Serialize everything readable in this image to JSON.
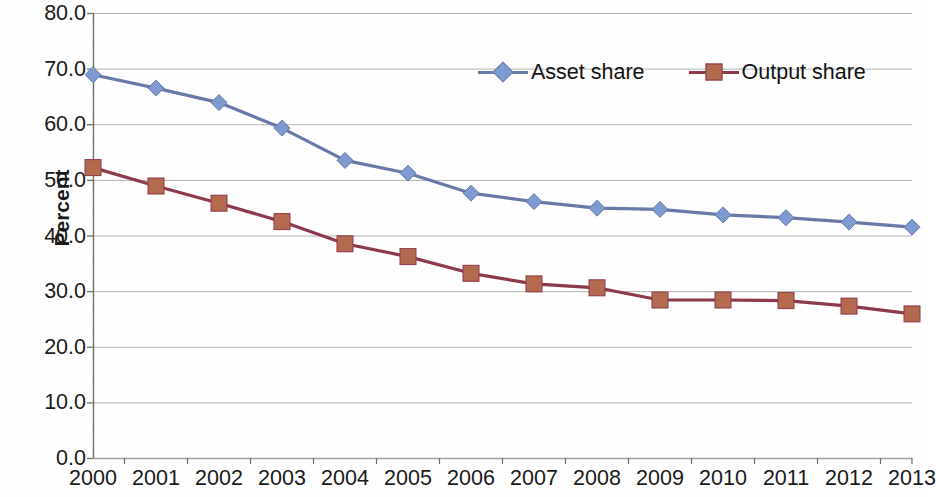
{
  "chart_data": {
    "type": "line",
    "title": "",
    "xlabel": "",
    "ylabel": "Percent",
    "ylim": [
      0.0,
      80.0
    ],
    "ytick_step": 10.0,
    "yticks": [
      "80.0",
      "70.0",
      "60.0",
      "50.0",
      "40.0",
      "30.0",
      "20.0",
      "10.0",
      "0.0"
    ],
    "grid": "horizontal",
    "legend_position": "top-center",
    "categories": [
      "2000",
      "2001",
      "2002",
      "2003",
      "2004",
      "2005",
      "2006",
      "2007",
      "2008",
      "2009",
      "2010",
      "2011",
      "2012",
      "2013"
    ],
    "series": [
      {
        "name": "Asset share",
        "color": "#6a7aa8",
        "marker": "diamond",
        "marker_color": "#7f9ad1",
        "values": [
          68.9,
          66.5,
          63.9,
          59.3,
          53.5,
          51.2,
          47.6,
          46.1,
          44.9,
          44.7,
          43.7,
          43.2,
          42.4,
          41.5
        ]
      },
      {
        "name": "Output share",
        "color": "#8c3a4c",
        "marker": "square",
        "marker_color": "#b46a4e",
        "values": [
          52.2,
          48.9,
          45.8,
          42.5,
          38.5,
          36.2,
          33.2,
          31.3,
          30.6,
          28.4,
          28.4,
          28.3,
          27.3,
          25.9
        ]
      }
    ]
  },
  "axes": {
    "y_label": "Percent"
  },
  "colors": {
    "asset_share_line": "#6a7aa8",
    "asset_share_marker": "#7f9ad1",
    "output_share_line": "#8c3a4c",
    "output_share_marker": "#b46a4e",
    "gridline": "#9a9a9a",
    "axis": "#6f6f6f",
    "text": "#1a1a1a"
  }
}
